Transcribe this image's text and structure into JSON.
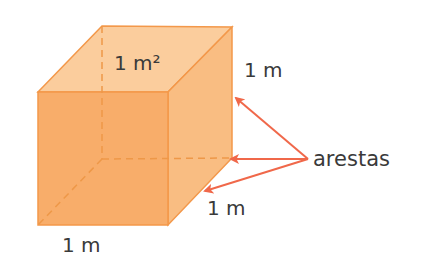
{
  "diagram": {
    "type": "cube",
    "colors": {
      "front_face": "#f8ad6a",
      "top_face": "#fbcd9d",
      "right_face": "#f9bd82",
      "edge": "#f3984a",
      "hidden_edge": "#ee9848",
      "arrow": "#f0684a",
      "text": "#3a3a3a"
    },
    "labels": {
      "top_area": "1 m²",
      "right_edge": "1 m",
      "depth_edge": "1 m",
      "bottom_edge": "1 m",
      "callout": "arestas"
    }
  }
}
